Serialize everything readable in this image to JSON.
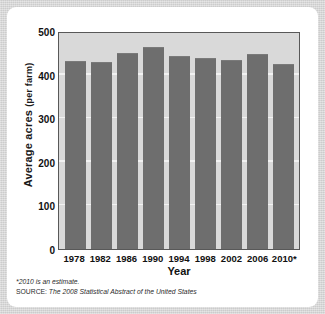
{
  "card": {
    "background_color": "#ffffff",
    "page_background_color": "#d4d4d4"
  },
  "chart_data": {
    "type": "bar",
    "title": "",
    "xlabel": "Year",
    "ylabel": "Average acres (per farm)",
    "ylabel_main": "Average acres",
    "ylabel_sub": "(per farm)",
    "categories": [
      "1978",
      "1982",
      "1986",
      "1990",
      "1994",
      "1998",
      "2002",
      "2006",
      "2010*"
    ],
    "values": [
      430,
      427,
      448,
      461,
      440,
      435,
      431,
      446,
      423
    ],
    "ylim": [
      0,
      500
    ],
    "yticks": [
      500,
      400,
      300,
      200,
      100,
      0
    ],
    "grid": true,
    "gridlines_at": [
      100,
      200,
      300,
      400
    ],
    "legend": "none",
    "bar_color": "#6e6e6e",
    "plot_background_color": "#d9d9d9",
    "gridline_color": "#f2f2f2",
    "axis_border_color": "#585858"
  },
  "notes": {
    "footnote": "*2010 is an estimate.",
    "source_label": "SOURCE:",
    "source_text": "The 2008 Statistical Abstract of the United States",
    "source_full": "SOURCE: The 2008 Statistical Abstract of the United States"
  }
}
